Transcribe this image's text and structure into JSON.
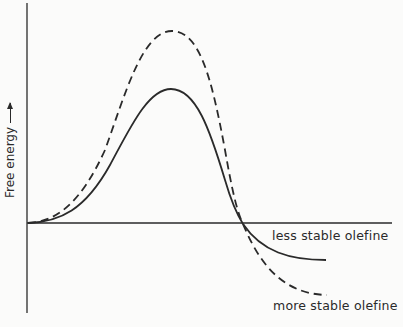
{
  "diagram": {
    "type": "energy profile",
    "y_axis_label": "Free energy",
    "y_axis_arrow": "arrow-up",
    "curves": [
      {
        "name": "less stable olefine",
        "style": "solid",
        "label": "less stable olefine"
      },
      {
        "name": "more stable olefine",
        "style": "dashed",
        "label": "more stable olefine"
      }
    ],
    "colors": {
      "line": "#2a2a2a",
      "background": "#fbfbfa"
    }
  }
}
